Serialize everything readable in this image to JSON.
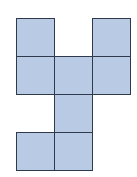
{
  "diagram": {
    "type": "cube-net",
    "grid": {
      "cols": 3,
      "rows": 4,
      "origin_x": 16,
      "origin_y": 18,
      "cell_size": 38
    },
    "fill_color": "#b9cae4",
    "line_color": "#2f3b4c",
    "cells": [
      {
        "row": 0,
        "col": 0
      },
      {
        "row": 0,
        "col": 2
      },
      {
        "row": 1,
        "col": 0
      },
      {
        "row": 1,
        "col": 1
      },
      {
        "row": 1,
        "col": 2
      },
      {
        "row": 2,
        "col": 1
      },
      {
        "row": 3,
        "col": 0
      },
      {
        "row": 3,
        "col": 1
      }
    ]
  }
}
